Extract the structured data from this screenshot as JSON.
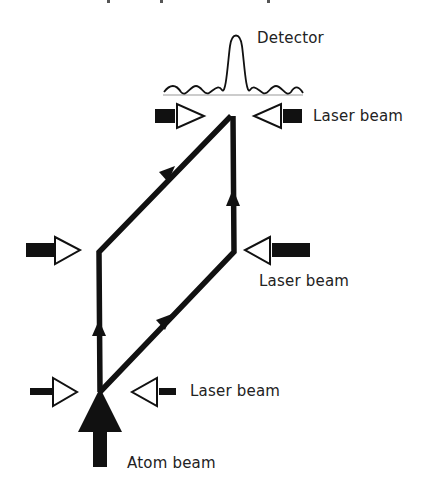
{
  "diagram": {
    "type": "atom interferometer schematic",
    "labels": {
      "detector": "Detector",
      "laser_top": "Laser beam",
      "laser_middle": "Laser beam",
      "laser_bottom": "Laser beam",
      "atom_beam": "Atom beam"
    },
    "colors": {
      "stroke": "#111111",
      "baseline": "#999999",
      "text": "#222222",
      "background": "#ffffff"
    },
    "components": [
      "atom-beam-source",
      "beam-splitter-pulse",
      "mirror-pulse",
      "recombiner-pulse",
      "interference-fringe-detector"
    ]
  }
}
